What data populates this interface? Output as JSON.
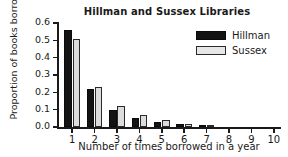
{
  "chart_data": {
    "type": "bar",
    "title": "Hillman and Sussex Libraries",
    "xlabel": "Number of times borrowed in a year",
    "ylabel": "Proportion of books borrowed",
    "categories": [
      "1",
      "2",
      "3",
      "4",
      "5",
      "6",
      "7",
      "8",
      "9",
      "10"
    ],
    "series": [
      {
        "name": "Hillman",
        "color": "#131313",
        "values": [
          0.56,
          0.22,
          0.1,
          0.05,
          0.03,
          0.015,
          0.005,
          0.0,
          0.0,
          0.0
        ]
      },
      {
        "name": "Sussex",
        "color": "#dcdcdc",
        "values": [
          0.51,
          0.23,
          0.12,
          0.07,
          0.04,
          0.015,
          0.005,
          0.0,
          0.0,
          0.0
        ]
      }
    ],
    "ylim": [
      0.0,
      0.6
    ],
    "yticks": [
      "0.0",
      "0.1",
      "0.2",
      "0.3",
      "0.4",
      "0.5",
      "0.6"
    ],
    "ytick_values": [
      0.0,
      0.1,
      0.2,
      0.3,
      0.4,
      0.5,
      0.6
    ],
    "grid": false,
    "legend_position": "top-right"
  },
  "legend": {
    "entries": [
      {
        "label": "Hillman"
      },
      {
        "label": "Sussex"
      }
    ]
  }
}
